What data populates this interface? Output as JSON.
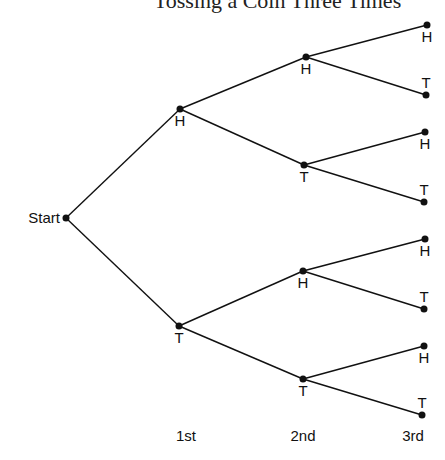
{
  "title": "Tossing a Coin Three Times",
  "diagram": {
    "type": "tree",
    "root": {
      "label": "Start",
      "x": 66,
      "y": 218
    },
    "levels": [
      {
        "label": "1st",
        "x": 186
      },
      {
        "label": "2nd",
        "x": 303
      },
      {
        "label": "3rd",
        "x": 413
      }
    ],
    "nodes": [
      {
        "id": "n1H",
        "label": "H",
        "x": 180,
        "y": 109,
        "parent": "root",
        "label_pos": "below"
      },
      {
        "id": "n1T",
        "label": "T",
        "x": 179,
        "y": 326,
        "parent": "root",
        "label_pos": "below"
      },
      {
        "id": "n2HH",
        "label": "H",
        "x": 306,
        "y": 57,
        "parent": "n1H",
        "label_pos": "below"
      },
      {
        "id": "n2HT",
        "label": "T",
        "x": 304,
        "y": 165,
        "parent": "n1H",
        "label_pos": "below"
      },
      {
        "id": "n2TH",
        "label": "H",
        "x": 303,
        "y": 271,
        "parent": "n1T",
        "label_pos": "below"
      },
      {
        "id": "n2TT",
        "label": "T",
        "x": 303,
        "y": 379,
        "parent": "n1T",
        "label_pos": "below"
      },
      {
        "id": "n3HHH",
        "label": "H",
        "x": 427,
        "y": 25,
        "parent": "n2HH",
        "label_pos": "below"
      },
      {
        "id": "n3HHT",
        "label": "T",
        "x": 426,
        "y": 95,
        "parent": "n2HH",
        "label_pos": "above"
      },
      {
        "id": "n3HTH",
        "label": "H",
        "x": 425,
        "y": 132,
        "parent": "n2HT",
        "label_pos": "below"
      },
      {
        "id": "n3HTT",
        "label": "T",
        "x": 424,
        "y": 202,
        "parent": "n2HT",
        "label_pos": "above"
      },
      {
        "id": "n3THH",
        "label": "H",
        "x": 425,
        "y": 239,
        "parent": "n2TH",
        "label_pos": "below"
      },
      {
        "id": "n3THT",
        "label": "T",
        "x": 424,
        "y": 309,
        "parent": "n2TH",
        "label_pos": "above"
      },
      {
        "id": "n3TTH",
        "label": "H",
        "x": 424,
        "y": 346,
        "parent": "n2TT",
        "label_pos": "below"
      },
      {
        "id": "n3TTT",
        "label": "T",
        "x": 422,
        "y": 415,
        "parent": "n2TT",
        "label_pos": "above"
      }
    ],
    "colors": {
      "line": "#111111",
      "node": "#111111",
      "background": "#ffffff"
    }
  }
}
